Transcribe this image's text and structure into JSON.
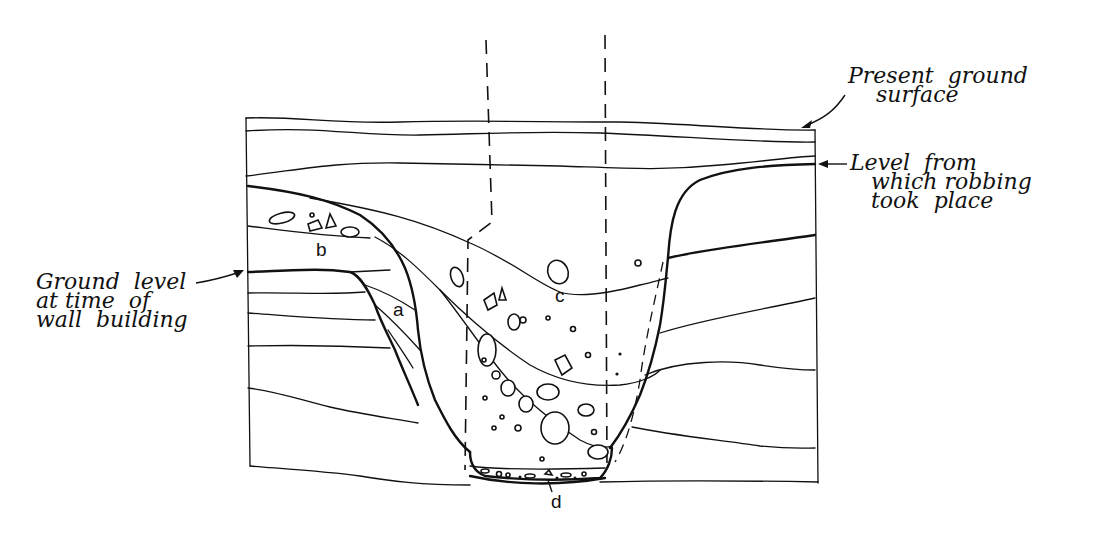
{
  "diagram": {
    "type": "archaeological-section",
    "annotations": [
      {
        "id": "present-ground-surface",
        "text": "Present  ground\n    surface"
      },
      {
        "id": "robbing-level",
        "text": "Level  from\n   which robbing\n   took  place"
      },
      {
        "id": "ground-level-wall",
        "text": "Ground  level\nat time  of\nwall  building"
      }
    ],
    "letters": {
      "a": "a",
      "b": "b",
      "c": "c",
      "d": "d"
    }
  }
}
